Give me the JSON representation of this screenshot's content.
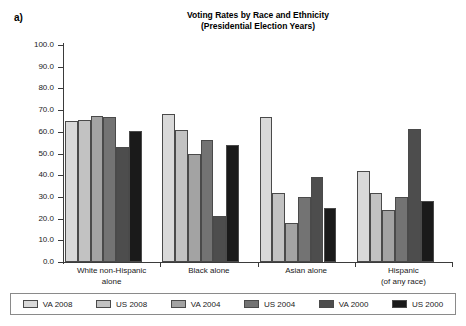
{
  "panel": {
    "label": "a)"
  },
  "title": {
    "line1": "Voting Rates by Race and Ethnicity",
    "line2": "(Presidential Election Years)"
  },
  "chart_data": {
    "type": "bar",
    "title": "Voting Rates by Race and Ethnicity (Presidential Election Years)",
    "xlabel": "",
    "ylabel": "",
    "ylim": [
      0,
      100
    ],
    "yticks": [
      "0.0",
      "10.0",
      "20.0",
      "30.0",
      "40.0",
      "50.0",
      "60.0",
      "70.0",
      "80.0",
      "90.0",
      "100.0"
    ],
    "grid": false,
    "legend_position": "bottom",
    "categories": [
      "White non-Hispanic alone",
      "Black alone",
      "Asian alone",
      "Hispanic (of any race)"
    ],
    "category_lines": [
      [
        "White non-Hispanic",
        "alone"
      ],
      [
        "Black alone"
      ],
      [
        "Asian alone"
      ],
      [
        "Hispanic",
        "(of any race)"
      ]
    ],
    "series": [
      {
        "name": "VA 2008",
        "color": "#d9d9d9",
        "values": [
          65.0,
          68.0,
          67.0,
          42.0
        ]
      },
      {
        "name": "US 2008",
        "color": "#c2c2c2",
        "values": [
          65.5,
          61.0,
          32.0,
          32.0
        ]
      },
      {
        "name": "VA 2004",
        "color": "#a3a3a3",
        "values": [
          67.5,
          50.0,
          18.0,
          24.0
        ]
      },
      {
        "name": "US 2004",
        "color": "#737373",
        "values": [
          67.0,
          56.0,
          30.0,
          30.0
        ]
      },
      {
        "name": "VA 2000",
        "color": "#4d4d4d",
        "values": [
          53.0,
          21.0,
          39.0,
          61.5
        ]
      },
      {
        "name": "US 2000",
        "color": "#1a1a1a",
        "values": [
          60.5,
          54.0,
          25.0,
          28.0
        ]
      }
    ]
  }
}
